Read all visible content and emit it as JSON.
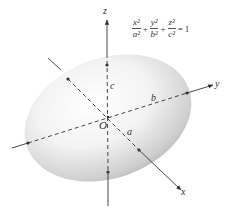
{
  "equation": {
    "terms": [
      {
        "num": "x²",
        "den": "a²"
      },
      {
        "num": "y²",
        "den": "b²"
      },
      {
        "num": "z²",
        "den": "c²"
      }
    ],
    "plus": "+",
    "equals": "=",
    "rhs": "1"
  },
  "axes": {
    "x_label": "x",
    "y_label": "y",
    "z_label": "z",
    "origin_label": "O"
  },
  "semi_axes": {
    "a_label": "a",
    "b_label": "b",
    "c_label": "c"
  },
  "colors": {
    "surface_light": "#ffffff",
    "surface_mid": "#d8d8d8",
    "surface_dark": "#a8a8a8",
    "line": "#333333"
  }
}
